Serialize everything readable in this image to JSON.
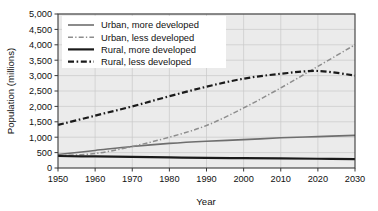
{
  "chart_data": {
    "type": "line",
    "title": "",
    "xlabel": "Year",
    "ylabel": "Population (millions)",
    "xlim": [
      1950,
      2030
    ],
    "ylim": [
      0,
      5000
    ],
    "xticks": [
      "1950",
      "1960",
      "1970",
      "1980",
      "1990",
      "2000",
      "2010",
      "2020",
      "2030"
    ],
    "yticks": [
      "0",
      "500",
      "1,000",
      "1,500",
      "2,000",
      "2,500",
      "3,000",
      "3,500",
      "4,000",
      "4,500",
      "5,000"
    ],
    "grid": true,
    "legend_position": "upper-left",
    "x": [
      1950,
      1960,
      1970,
      1980,
      1990,
      2000,
      2010,
      2020,
      2030
    ],
    "series": [
      {
        "name": "Urban, more developed",
        "style": "solid",
        "color": "#6e6e6e",
        "width": 1.6,
        "values": [
          440,
          570,
          700,
          800,
          870,
          920,
          980,
          1020,
          1060
        ]
      },
      {
        "name": "Urban, less developed",
        "style": "dash-dot",
        "color": "#8d8d8d",
        "width": 1.5,
        "values": [
          400,
          470,
          700,
          1000,
          1380,
          1950,
          2600,
          3300,
          4000
        ]
      },
      {
        "name": "Rural, more developed",
        "style": "solid",
        "color": "#1a1a1a",
        "width": 2.2,
        "values": [
          390,
          375,
          360,
          345,
          330,
          320,
          310,
          300,
          290
        ]
      },
      {
        "name": "Rural, less developed",
        "style": "dash-dot",
        "color": "#1a1a1a",
        "width": 2.2,
        "values": [
          1400,
          1700,
          2000,
          2330,
          2640,
          2900,
          3060,
          3150,
          3000
        ]
      }
    ]
  },
  "figure": {
    "plot_background": "#ebebeb",
    "grid_color": "#c8c8c8",
    "frame_color": "#3a3a3a",
    "page_background": "#ffffff"
  }
}
